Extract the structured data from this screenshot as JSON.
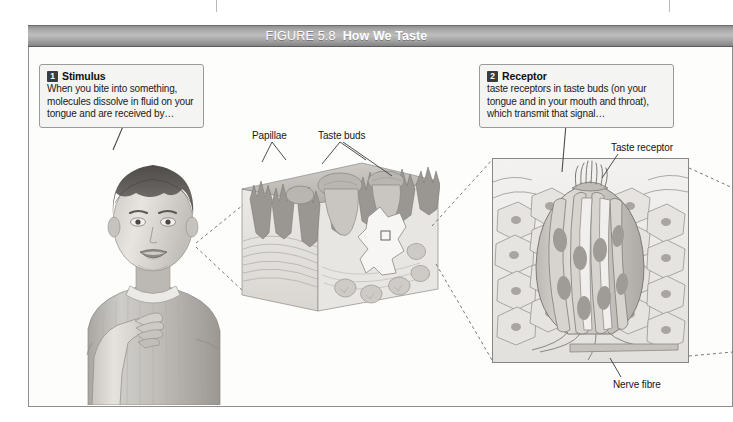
{
  "figure": {
    "number": "FIGURE 5.8",
    "title": "How We Taste"
  },
  "callouts": [
    {
      "badge": "1",
      "title": "Stimulus",
      "body": "When you bite into something, molecules dissolve in fluid on your tongue and are received by…"
    },
    {
      "badge": "2",
      "title": "Receptor",
      "body": "taste receptors in taste buds (on your tongue and in your mouth and throat), which transmit that signal…"
    }
  ],
  "labels": {
    "papillae": "Papillae",
    "taste_buds": "Taste buds",
    "taste_receptor": "Taste receptor",
    "nerve_fibre": "Nerve fibre"
  },
  "artwork": {
    "child": "child-tasting-illustration",
    "tissue_block": "tongue-tissue-block-illustration",
    "taste_bud": "taste-bud-cross-section-illustration"
  },
  "colors": {
    "header_gradient_light": "#bdbdbd",
    "header_gradient_dark": "#848484",
    "frame_border": "#8d8d8d",
    "callout_bg": "#f4f4f2",
    "badge_bg": "#3b3b3b",
    "page_bg": "#ffffff"
  }
}
